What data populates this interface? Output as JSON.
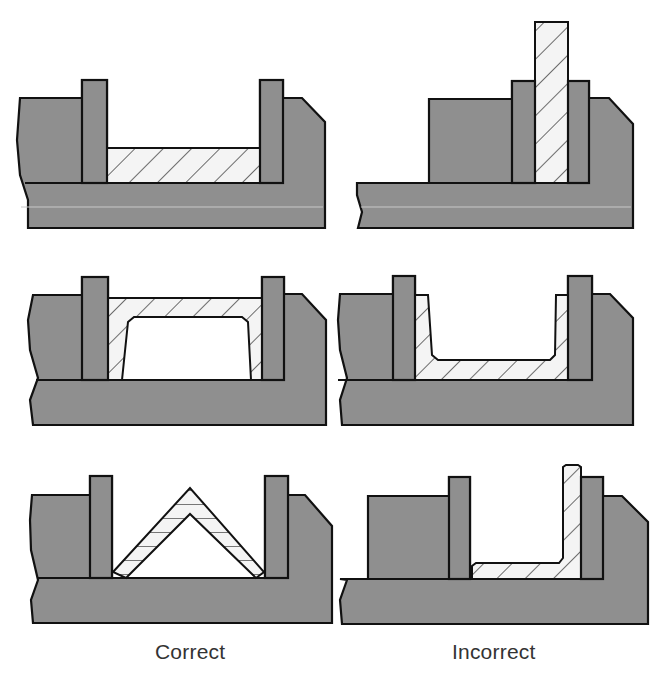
{
  "labels": {
    "correct": "Correct",
    "incorrect": "Incorrect"
  },
  "colors": {
    "body_fill": "#8f8f8f",
    "hatched_fill": "#f4f4f4",
    "stroke": "#111111",
    "hatch_line": "#222222",
    "highlight_line": "#c8c8c8"
  },
  "panels": [
    {
      "id": "correct-flat-plate",
      "column": "Correct",
      "row": 1,
      "description": "Flat hatched plate seated between two posts on base",
      "body": [
        [
          20,
          98
        ],
        [
          82,
          98
        ],
        [
          82,
          80
        ],
        [
          107,
          80
        ],
        [
          107,
          183
        ],
        [
          260,
          183
        ],
        [
          260,
          80
        ],
        [
          283,
          80
        ],
        [
          283,
          98
        ],
        [
          302,
          98
        ],
        [
          325,
          122
        ],
        [
          325,
          228
        ],
        [
          28,
          228
        ],
        [
          28,
          200
        ],
        [
          20,
          175
        ],
        [
          17,
          140
        ],
        [
          20,
          98
        ]
      ],
      "highlight_y": 207,
      "posts": [
        [
          82,
          80,
          25,
          103
        ],
        [
          260,
          80,
          23,
          103
        ]
      ],
      "hatched": [
        [
          [
            107,
            148
          ],
          [
            260,
            148
          ],
          [
            260,
            183
          ],
          [
            107,
            183
          ]
        ]
      ],
      "cavities": []
    },
    {
      "id": "incorrect-vertical-plate",
      "column": "Incorrect",
      "row": 1,
      "description": "Hatched plate standing vertically between posts",
      "body": [
        [
          357,
          183
        ],
        [
          429,
          183
        ],
        [
          429,
          99
        ],
        [
          512,
          99
        ],
        [
          512,
          81
        ],
        [
          535,
          81
        ],
        [
          535,
          183
        ],
        [
          568,
          183
        ],
        [
          568,
          81
        ],
        [
          589,
          81
        ],
        [
          589,
          98
        ],
        [
          609,
          98
        ],
        [
          633,
          124
        ],
        [
          633,
          228
        ],
        [
          358,
          228
        ],
        [
          362,
          212
        ],
        [
          357,
          195
        ]
      ],
      "highlight_y": 207,
      "posts": [
        [
          512,
          81,
          23,
          102
        ],
        [
          568,
          81,
          21,
          102
        ]
      ],
      "hatched": [
        [
          [
            535,
            22
          ],
          [
            568,
            22
          ],
          [
            568,
            183
          ],
          [
            535,
            183
          ]
        ]
      ],
      "cavities": []
    },
    {
      "id": "correct-inverted-channel",
      "column": "Correct",
      "row": 2,
      "description": "Inverted hatched channel with open cavity seated between posts",
      "body": [
        [
          33,
          295
        ],
        [
          82,
          295
        ],
        [
          82,
          277
        ],
        [
          108,
          277
        ],
        [
          108,
          380
        ],
        [
          262,
          380
        ],
        [
          262,
          277
        ],
        [
          284,
          277
        ],
        [
          284,
          294
        ],
        [
          302,
          294
        ],
        [
          326,
          320
        ],
        [
          326,
          425
        ],
        [
          33,
          425
        ],
        [
          30,
          400
        ],
        [
          38,
          378
        ],
        [
          30,
          350
        ],
        [
          28,
          320
        ]
      ],
      "highlight_y": null,
      "posts": [
        [
          82,
          277,
          26,
          103
        ],
        [
          262,
          277,
          22,
          103
        ]
      ],
      "hatched": [
        [
          [
            108,
            298
          ],
          [
            262,
            298
          ],
          [
            262,
            380
          ],
          [
            108,
            380
          ]
        ]
      ],
      "cavities": [
        [
          [
            122,
            380
          ],
          [
            128,
            322
          ],
          [
            134,
            317
          ],
          [
            242,
            317
          ],
          [
            248,
            322
          ],
          [
            251,
            380
          ]
        ]
      ]
    },
    {
      "id": "incorrect-upright-channel",
      "column": "Incorrect",
      "row": 2,
      "description": "Upright hatched channel, open side up",
      "body": [
        [
          340,
          294
        ],
        [
          393,
          294
        ],
        [
          393,
          276
        ],
        [
          415,
          276
        ],
        [
          415,
          380
        ],
        [
          568,
          380
        ],
        [
          568,
          276
        ],
        [
          592,
          276
        ],
        [
          592,
          294
        ],
        [
          610,
          294
        ],
        [
          633,
          318
        ],
        [
          633,
          425
        ],
        [
          342,
          425
        ],
        [
          340,
          400
        ],
        [
          347,
          378
        ],
        [
          340,
          350
        ],
        [
          338,
          320
        ]
      ],
      "highlight_y": null,
      "posts": [
        [
          393,
          276,
          22,
          104
        ],
        [
          568,
          276,
          24,
          104
        ]
      ],
      "hatched": [
        [
          [
            415,
            295
          ],
          [
            428,
            295
          ],
          [
            432,
            355
          ],
          [
            438,
            360
          ],
          [
            550,
            360
          ],
          [
            555,
            355
          ],
          [
            556,
            295
          ],
          [
            568,
            295
          ],
          [
            568,
            380
          ],
          [
            415,
            380
          ]
        ]
      ],
      "cavities": []
    },
    {
      "id": "correct-v-shape",
      "column": "Correct",
      "row": 3,
      "description": "Hatched inverted-V part between posts",
      "body": [
        [
          32,
          495
        ],
        [
          90,
          495
        ],
        [
          90,
          476
        ],
        [
          112,
          476
        ],
        [
          112,
          578
        ],
        [
          265,
          578
        ],
        [
          265,
          476
        ],
        [
          288,
          476
        ],
        [
          288,
          495
        ],
        [
          305,
          495
        ],
        [
          332,
          526
        ],
        [
          332,
          623
        ],
        [
          33,
          623
        ],
        [
          31,
          600
        ],
        [
          38,
          580
        ],
        [
          31,
          550
        ],
        [
          30,
          520
        ]
      ],
      "highlight_y": null,
      "posts": [
        [
          90,
          476,
          22,
          102
        ],
        [
          265,
          476,
          23,
          102
        ]
      ],
      "hatched": [
        [
          [
            113,
            572
          ],
          [
            190,
            488
          ],
          [
            264,
            572
          ],
          [
            256,
            578
          ],
          [
            190,
            514
          ],
          [
            126,
            578
          ]
        ]
      ],
      "cavities": []
    },
    {
      "id": "incorrect-l-shape",
      "column": "Incorrect",
      "row": 3,
      "description": "Hatched L-shaped part resting in gap, extending above post",
      "body": [
        [
          340,
          579
        ],
        [
          368,
          579
        ],
        [
          368,
          496
        ],
        [
          449,
          496
        ],
        [
          449,
          477
        ],
        [
          470,
          477
        ],
        [
          470,
          579
        ],
        [
          581,
          579
        ],
        [
          581,
          477
        ],
        [
          603,
          477
        ],
        [
          603,
          496
        ],
        [
          622,
          496
        ],
        [
          648,
          522
        ],
        [
          648,
          624
        ],
        [
          342,
          624
        ],
        [
          340,
          600
        ],
        [
          347,
          580
        ]
      ],
      "highlight_y": null,
      "posts": [
        [
          449,
          477,
          21,
          102
        ],
        [
          581,
          477,
          22,
          102
        ]
      ],
      "hatched": [
        [
          [
            472,
            579
          ],
          [
            472,
            566
          ],
          [
            476,
            563
          ],
          [
            559,
            563
          ],
          [
            563,
            558
          ],
          [
            563,
            467
          ],
          [
            566,
            465
          ],
          [
            578,
            465
          ],
          [
            581,
            467
          ],
          [
            581,
            579
          ]
        ]
      ],
      "cavities": []
    }
  ]
}
